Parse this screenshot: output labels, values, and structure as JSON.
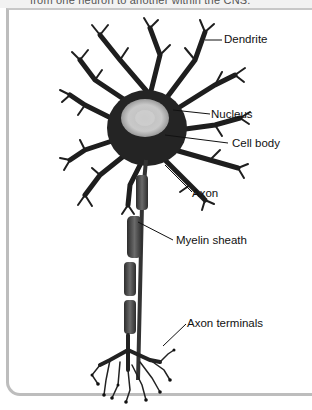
{
  "caption": {
    "partial_text": "from one neuron to another within the CNS."
  },
  "diagram": {
    "labels": [
      {
        "id": "dendrite",
        "text": "Dendrite"
      },
      {
        "id": "nucleus",
        "text": "Nucleus"
      },
      {
        "id": "cell_body",
        "text": "Cell body"
      },
      {
        "id": "axon",
        "text": "Axon"
      },
      {
        "id": "myelin_sheath",
        "text": "Myelin sheath"
      },
      {
        "id": "axon_terminals",
        "text": "Axon terminals"
      }
    ]
  }
}
